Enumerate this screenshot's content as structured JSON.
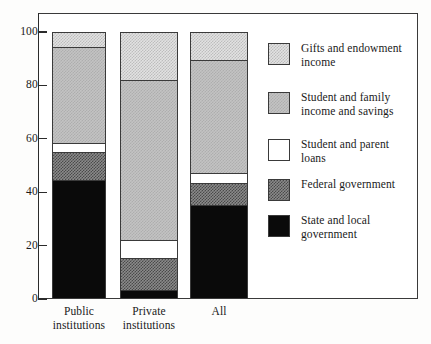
{
  "chart_data": {
    "type": "bar",
    "subtype": "stacked-bar-100-percent",
    "title": "",
    "subtitle": "",
    "xlabel": "",
    "ylabel": "",
    "ylim": [
      0,
      100
    ],
    "yticks": [
      0,
      20,
      40,
      60,
      80,
      100
    ],
    "ytick_labels": [
      "0",
      "20",
      "40",
      "60",
      "80",
      "100"
    ],
    "grid": false,
    "legend_position": "right",
    "categories": [
      "Public institutions",
      "Private institutions",
      "All"
    ],
    "category_label_lines": [
      [
        "Public",
        "institutions"
      ],
      [
        "Private",
        "institutions"
      ],
      [
        "All",
        ""
      ]
    ],
    "series": [
      {
        "name": "State and local government",
        "color": "#0a0a0a",
        "pattern": "solid-black",
        "values": [
          44.6,
          3.4,
          35.2
        ]
      },
      {
        "name": "Federal government",
        "color": "#7a7a7a",
        "pattern": "dark-halftone",
        "values": [
          10.5,
          12.0,
          8.2
        ]
      },
      {
        "name": "Student and parent loans",
        "color": "#ffffff",
        "pattern": "white",
        "values": [
          3.3,
          6.7,
          3.8
        ]
      },
      {
        "name": "Student and family income and savings",
        "color": "#c3c3c3",
        "pattern": "mid-halftone",
        "values": [
          36.0,
          59.9,
          42.3
        ]
      },
      {
        "name": "Gifts and endowment income",
        "color": "#e2e2e2",
        "pattern": "light-halftone",
        "values": [
          5.6,
          18.0,
          10.5
        ]
      }
    ],
    "stack_boundaries": {
      "Public institutions": [
        0,
        44.6,
        55.1,
        58.4,
        94.4,
        100.0
      ],
      "Private institutions": [
        0,
        3.4,
        15.4,
        22.1,
        82.0,
        100.0
      ],
      "All": [
        0,
        35.2,
        43.4,
        47.2,
        89.5,
        100.0
      ]
    }
  },
  "axis": {
    "y_labels": [
      "100",
      "80",
      "60",
      "40",
      "20",
      "0"
    ]
  },
  "legend": {
    "items": [
      {
        "label_line1": "Gifts and endowment",
        "label_line2": "income",
        "swatch": "light-halftone"
      },
      {
        "label_line1": "Student and family",
        "label_line2": "income and savings",
        "swatch": "mid-halftone"
      },
      {
        "label_line1": "Student and parent",
        "label_line2": "loans",
        "swatch": "white"
      },
      {
        "label_line1": "Federal government",
        "label_line2": "",
        "swatch": "dark-halftone"
      },
      {
        "label_line1": "State and local",
        "label_line2": "government",
        "swatch": "solid-black"
      }
    ]
  },
  "xaxis": {
    "labels": [
      {
        "line1": "Public",
        "line2": "institutions"
      },
      {
        "line1": "Private",
        "line2": "institutions"
      },
      {
        "line1": "All",
        "line2": ""
      }
    ]
  },
  "colors": {
    "frame": "#3a3a3a",
    "text": "#1a1a1a",
    "background": "#fdfdfc",
    "solid_black": "#0a0a0a",
    "dark_gray": "#7a7a7a",
    "white": "#ffffff",
    "mid_gray": "#c3c3c3",
    "light_gray": "#e2e2e2"
  }
}
